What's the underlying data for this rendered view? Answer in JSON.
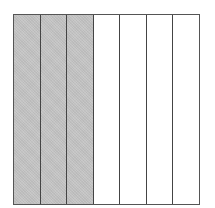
{
  "diagram": {
    "type": "fraction-strip",
    "total_parts": 7,
    "shaded_parts": 3,
    "fraction": "3/7",
    "colors": {
      "shaded": "#c4c4c4",
      "unshaded": "#ffffff",
      "border": "#555555"
    },
    "strips": [
      {
        "index": 1,
        "shaded": true
      },
      {
        "index": 2,
        "shaded": true
      },
      {
        "index": 3,
        "shaded": true
      },
      {
        "index": 4,
        "shaded": false
      },
      {
        "index": 5,
        "shaded": false
      },
      {
        "index": 6,
        "shaded": false
      },
      {
        "index": 7,
        "shaded": false
      }
    ]
  }
}
